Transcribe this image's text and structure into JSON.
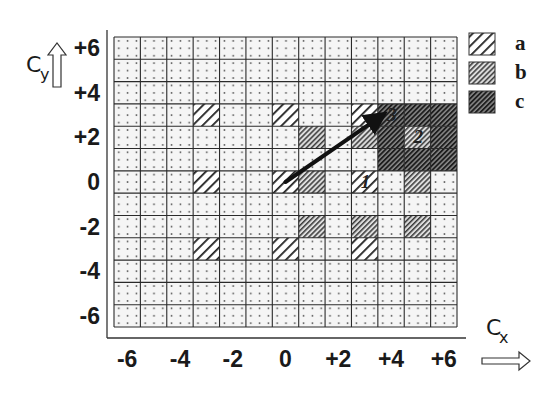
{
  "chart_data": {
    "type": "grid-diagram",
    "title": "",
    "x_axis": {
      "label": "C",
      "subscript": "x",
      "ticks": [
        "-6",
        "-4",
        "-2",
        "0",
        "+2",
        "+4",
        "+6"
      ],
      "tick_values": [
        -6,
        -4,
        -2,
        0,
        2,
        4,
        6
      ],
      "range": [
        -6,
        6
      ]
    },
    "y_axis": {
      "label": "C",
      "subscript": "y",
      "ticks": [
        "+6",
        "+4",
        "+2",
        "0",
        "-2",
        "-4",
        "-6"
      ],
      "tick_values": [
        6,
        4,
        2,
        0,
        -2,
        -4,
        -6
      ],
      "range": [
        -6,
        6
      ]
    },
    "grid": {
      "columns": 13,
      "rows": 13,
      "background_pattern": "dotted"
    },
    "legend": [
      {
        "key": "a",
        "label": "a",
        "pattern": "light-wide-hatch"
      },
      {
        "key": "b",
        "label": "b",
        "pattern": "medium-dense-hatch"
      },
      {
        "key": "c",
        "label": "c",
        "pattern": "dark-dense-hatch"
      }
    ],
    "cells": [
      {
        "x": -3,
        "y": 3,
        "type": "a"
      },
      {
        "x": 0,
        "y": 3,
        "type": "a"
      },
      {
        "x": 3,
        "y": 3,
        "type": "a"
      },
      {
        "x": 4,
        "y": 3,
        "type": "c"
      },
      {
        "x": 5,
        "y": 3,
        "type": "c"
      },
      {
        "x": 6,
        "y": 3,
        "type": "c"
      },
      {
        "x": 1,
        "y": 2,
        "type": "b"
      },
      {
        "x": 3,
        "y": 2,
        "type": "b"
      },
      {
        "x": 4,
        "y": 2,
        "type": "c"
      },
      {
        "x": 5,
        "y": 2,
        "type": "b"
      },
      {
        "x": 6,
        "y": 2,
        "type": "c"
      },
      {
        "x": 4,
        "y": 1,
        "type": "c"
      },
      {
        "x": 5,
        "y": 1,
        "type": "c"
      },
      {
        "x": 6,
        "y": 1,
        "type": "c"
      },
      {
        "x": -3,
        "y": 0,
        "type": "a"
      },
      {
        "x": 0,
        "y": 0,
        "type": "a"
      },
      {
        "x": 1,
        "y": 0,
        "type": "b"
      },
      {
        "x": 3,
        "y": 0,
        "type": "a"
      },
      {
        "x": 5,
        "y": 0,
        "type": "b"
      },
      {
        "x": 1,
        "y": -2,
        "type": "b"
      },
      {
        "x": 3,
        "y": -2,
        "type": "b"
      },
      {
        "x": 5,
        "y": -2,
        "type": "b"
      },
      {
        "x": -3,
        "y": -3,
        "type": "a"
      },
      {
        "x": 0,
        "y": -3,
        "type": "a"
      },
      {
        "x": 3,
        "y": -3,
        "type": "a"
      }
    ],
    "annotations": [
      {
        "text": "1",
        "x": 3,
        "y": 0
      },
      {
        "text": "2",
        "x": 5,
        "y": 2
      },
      {
        "text": "3",
        "x": 4,
        "y": 3
      }
    ],
    "vector": {
      "from": [
        0,
        0
      ],
      "to": [
        3.5,
        2.85
      ]
    }
  },
  "colors": {
    "ink": "#1a1a1a",
    "grid_line": "#2a2a2a",
    "cell_bg": "#f4f4f4",
    "dot": "#555555",
    "hatch_a_bg": "#ffffff",
    "hatch_b_bg": "#d8d8d8",
    "hatch_c_bg": "#7a7a7a"
  }
}
